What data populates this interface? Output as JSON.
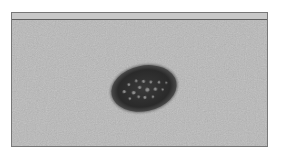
{
  "image": {
    "description": "Grayscale clinical photograph of a dark oval pigmented skin lesion on textured skin, inside a thin rectangular frame",
    "colors": {
      "background": "#ffffff",
      "frame_border": "#777777",
      "top_bar": "#c8c8c8",
      "top_bar_line": "#5e5e5e",
      "skin": "#b9b9b9",
      "lesion": "#2e2e2e",
      "lesion_spots": "#8a8a8a"
    },
    "lesion": {
      "cx": 132,
      "cy": 69,
      "rx": 34,
      "ry": 24,
      "rotate": -12
    }
  }
}
